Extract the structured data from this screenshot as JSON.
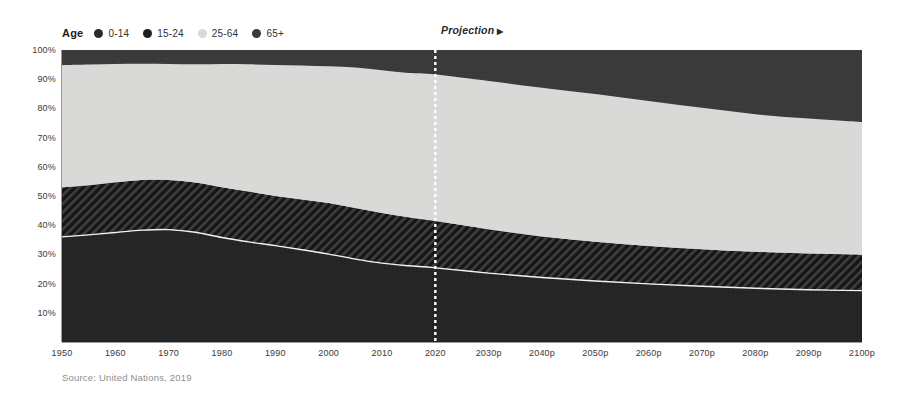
{
  "legend": {
    "title": "Age",
    "items": [
      {
        "label": "0-14",
        "color": "#2a2a2a"
      },
      {
        "label": "15-24",
        "color": "#1e1e1e"
      },
      {
        "label": "25-64",
        "color": "#d9dad7"
      },
      {
        "label": "65+",
        "color": "#3a3a3a"
      }
    ]
  },
  "annotation": {
    "projection_label": "Projection",
    "projection_arrow": "▶"
  },
  "source": {
    "text": "Source: United Nations, 2019"
  },
  "axis": {
    "y_ticks": [
      "100%",
      "90%",
      "80%",
      "70%",
      "60%",
      "50%",
      "40%",
      "30%",
      "20%",
      "10%"
    ],
    "x_ticks": [
      "1950",
      "1960",
      "1970",
      "1980",
      "1990",
      "2000",
      "2010",
      "2020",
      "2030p",
      "2040p",
      "2050p",
      "2060p",
      "2070p",
      "2080p",
      "2090p",
      "2100p"
    ]
  },
  "colors": {
    "age_0_14": "#262626",
    "age_15_24": "#1a1a1a",
    "age_15_24_hatch": "#3d3d3d",
    "age_25_64": "#d9dad7",
    "age_65_plus": "#3b3b3b",
    "divider_line": "#f2f2f2",
    "projection_line": "#ffffff",
    "axis_line": "#9a9a9a",
    "background": "#ffffff"
  },
  "chart_data": {
    "type": "area",
    "title": "",
    "subtitle": "",
    "xlabel": "",
    "ylabel": "",
    "stacked": true,
    "normalized_percent": true,
    "ylim": [
      0,
      100
    ],
    "grid": false,
    "legend_position": "top-left",
    "projection_starts_at": "2020",
    "x": [
      1950,
      1955,
      1960,
      1965,
      1970,
      1975,
      1980,
      1985,
      1990,
      1995,
      2000,
      2005,
      2010,
      2015,
      2020,
      2030,
      2040,
      2050,
      2060,
      2070,
      2080,
      2090,
      2100
    ],
    "x_labels": [
      "1950",
      "1960",
      "1970",
      "1980",
      "1990",
      "2000",
      "2010",
      "2020",
      "2030p",
      "2040p",
      "2050p",
      "2060p",
      "2070p",
      "2080p",
      "2090p",
      "2100p"
    ],
    "series": [
      {
        "name": "0-14",
        "values": [
          36.0,
          36.7,
          37.5,
          38.3,
          38.5,
          37.6,
          35.8,
          34.3,
          33.0,
          31.6,
          30.1,
          28.4,
          27.0,
          26.1,
          25.4,
          23.6,
          22.1,
          20.9,
          19.9,
          19.1,
          18.4,
          17.9,
          17.6
        ]
      },
      {
        "name": "15-24",
        "values": [
          17.0,
          17.0,
          17.2,
          17.2,
          17.0,
          17.0,
          17.2,
          17.2,
          17.0,
          17.2,
          17.5,
          17.5,
          17.2,
          16.6,
          16.0,
          15.0,
          14.0,
          13.4,
          13.0,
          12.7,
          12.5,
          12.4,
          12.3
        ]
      },
      {
        "name": "25-64",
        "values": [
          41.8,
          41.3,
          40.5,
          39.8,
          39.7,
          40.5,
          42.2,
          43.6,
          44.9,
          45.9,
          46.8,
          48.1,
          48.9,
          49.4,
          50.2,
          50.8,
          51.0,
          50.6,
          49.6,
          48.4,
          47.1,
          46.2,
          45.4
        ]
      },
      {
        "name": "65+",
        "values": [
          5.2,
          5.0,
          4.8,
          4.7,
          4.8,
          4.9,
          4.8,
          4.9,
          5.1,
          5.3,
          5.6,
          6.0,
          6.9,
          7.9,
          8.4,
          10.6,
          12.9,
          15.1,
          17.5,
          19.8,
          22.0,
          23.5,
          24.7
        ]
      }
    ],
    "cumulative_top_edges": {
      "0-14": [
        36.0,
        36.7,
        37.5,
        38.3,
        38.5,
        37.6,
        35.8,
        34.3,
        33.0,
        31.6,
        30.1,
        28.4,
        27.0,
        26.1,
        25.4,
        23.6,
        22.1,
        20.9,
        19.9,
        19.1,
        18.4,
        17.9,
        17.6
      ],
      "15-24": [
        53.0,
        53.7,
        54.7,
        55.5,
        55.5,
        54.6,
        53.0,
        51.5,
        50.0,
        48.8,
        47.6,
        45.9,
        44.2,
        42.7,
        41.4,
        38.6,
        36.1,
        34.3,
        32.9,
        31.8,
        30.9,
        30.3,
        29.9
      ],
      "25-64": [
        94.8,
        95.0,
        95.2,
        95.3,
        95.2,
        95.1,
        95.2,
        95.1,
        94.9,
        94.7,
        94.4,
        94.0,
        93.1,
        92.1,
        91.6,
        89.4,
        87.1,
        84.9,
        82.5,
        80.2,
        78.0,
        76.5,
        75.3
      ],
      "65+": [
        100,
        100,
        100,
        100,
        100,
        100,
        100,
        100,
        100,
        100,
        100,
        100,
        100,
        100,
        100,
        100,
        100,
        100,
        100,
        100,
        100,
        100,
        100
      ]
    }
  }
}
